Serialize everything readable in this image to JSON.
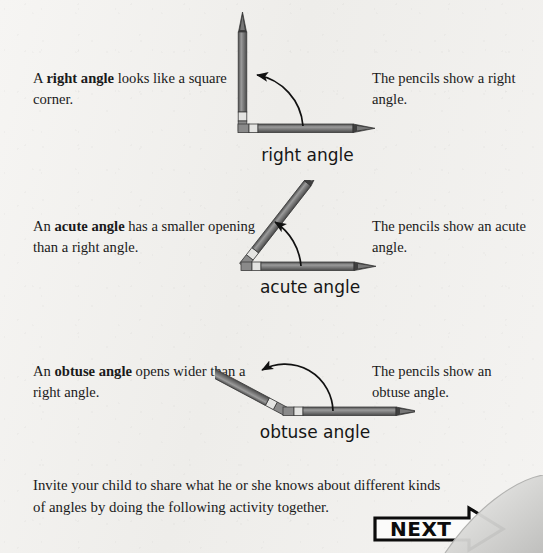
{
  "page": {
    "background_color": "#f2f1ef",
    "ink_color": "#1a1a1a"
  },
  "sections": [
    {
      "id": "right-angle",
      "left_text_prefix": "A ",
      "left_text_bold": "right angle",
      "left_text_suffix": " looks like a square corner.",
      "figure_label": "right angle",
      "right_text": "The pencils show a right angle.",
      "angle_degrees": 90
    },
    {
      "id": "acute-angle",
      "left_text_prefix": "An ",
      "left_text_bold": "acute angle",
      "left_text_suffix": " has a smaller opening than a right angle.",
      "figure_label": "acute angle",
      "right_text": "The pencils show an acute angle.",
      "angle_degrees": 52
    },
    {
      "id": "obtuse-angle",
      "left_text_prefix": "An ",
      "left_text_bold": "obtuse angle",
      "left_text_suffix": " opens wider than a right angle.",
      "figure_label": "obtuse angle",
      "right_text": "The pencils show an obtuse angle.",
      "angle_degrees": 150
    }
  ],
  "bottom_note": "Invite your child to share what he or she knows about different kinds of angles by doing the following activity together.",
  "next_button": {
    "label": "NEXT",
    "icon": "arrow-right-icon"
  },
  "pencil_colors": {
    "body": "#8d8d8d",
    "body_dark": "#575757",
    "outline": "#3c3c3c",
    "ferrule": "#e2e2e0",
    "tip": "#4a4a4a"
  }
}
